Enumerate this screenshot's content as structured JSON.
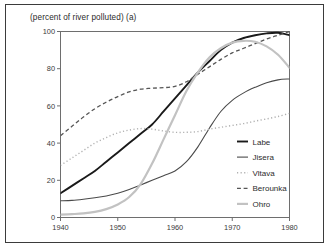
{
  "chart_data": {
    "type": "line",
    "title": "(percent of river polluted) (a)",
    "xlabel": "",
    "ylabel": "",
    "xlim": [
      1940,
      1980
    ],
    "ylim": [
      0,
      100
    ],
    "xticks": [
      1940,
      1950,
      1960,
      1970,
      1980
    ],
    "yticks": [
      0,
      20,
      40,
      60,
      80,
      100
    ],
    "grid": false,
    "legend_position": "right-inside",
    "x": [
      1940,
      1942,
      1944,
      1946,
      1948,
      1950,
      1952,
      1954,
      1956,
      1958,
      1960,
      1962,
      1964,
      1966,
      1968,
      1970,
      1972,
      1974,
      1976,
      1978,
      1980
    ],
    "series": [
      {
        "name": "Labe",
        "style": "solid",
        "color": "#1a1a1a",
        "width": 1.9,
        "values": [
          13,
          17,
          21,
          25,
          30,
          35,
          40,
          45,
          50,
          57,
          64,
          71,
          78,
          84,
          90,
          94,
          96.5,
          98,
          99,
          99.3,
          98
        ]
      },
      {
        "name": "Jisera",
        "style": "solid",
        "color": "#4a4a4a",
        "width": 1.1,
        "values": [
          9,
          9.2,
          9.8,
          10.6,
          11.6,
          13,
          15,
          17.5,
          20,
          22.5,
          25,
          30,
          38,
          48,
          57,
          63,
          67,
          70,
          72.5,
          74,
          74.5
        ]
      },
      {
        "name": "Vltava",
        "style": "dotted",
        "color": "#b0b0b0",
        "width": 1.4,
        "values": [
          28,
          32,
          36,
          40,
          43,
          45.5,
          47,
          47.8,
          47.5,
          46.5,
          45.8,
          45.8,
          46.2,
          47.5,
          48.5,
          49.5,
          50.5,
          51.8,
          53,
          54.3,
          56
        ]
      },
      {
        "name": "Berounka",
        "style": "dashed",
        "color": "#555555",
        "width": 1.3,
        "values": [
          44,
          49,
          54,
          58.5,
          62,
          65,
          67.5,
          69,
          69.5,
          69.8,
          70.5,
          73,
          77,
          81,
          85,
          88.5,
          91,
          93.5,
          96,
          98,
          100
        ]
      },
      {
        "name": "Ohro",
        "style": "solid",
        "color": "#c2c2c2",
        "width": 2.2,
        "values": [
          1.5,
          1.8,
          2.2,
          3,
          4.5,
          7,
          11,
          18,
          29,
          42,
          55,
          68,
          78,
          86,
          91,
          94,
          95,
          94.5,
          92,
          87.5,
          80.5
        ]
      }
    ]
  }
}
